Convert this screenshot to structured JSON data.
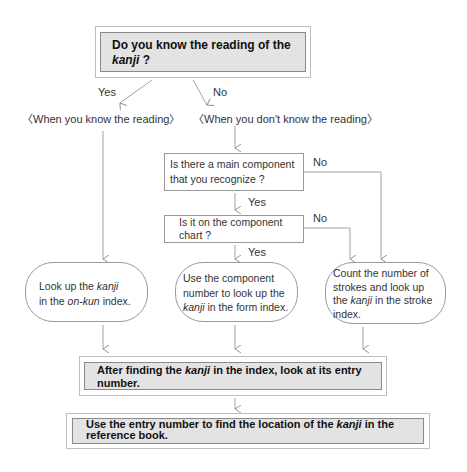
{
  "start": {
    "line1": "Do you know the reading of the",
    "line2_italic": "kanji",
    "line2_rest": " ?"
  },
  "branches": {
    "yes_label": "Yes",
    "no_label": "No",
    "known_heading": "〈When you know the reading〉",
    "unknown_heading": "〈When you don't know the reading〉"
  },
  "questions": {
    "main_component": {
      "line1": "Is there a main component",
      "line2": "that you recognize ?",
      "yes_label": "Yes",
      "no_label": "No"
    },
    "component_chart": {
      "line1": "Is it on the component",
      "line2": "chart ?",
      "yes_label": "Yes",
      "no_label": "No"
    }
  },
  "actions": {
    "onkun": {
      "t1": "Look up the ",
      "t2_italic": "kanji",
      "t3": "in the ",
      "t4_italic": "on-kun",
      "t5": " index."
    },
    "form": {
      "t1": "Use the component",
      "t2": "number to look up the",
      "t3_italic": "kanji",
      "t4": " in the form index."
    },
    "stroke": {
      "t1": "Count the number of",
      "t2": "strokes and look up",
      "t3": "the ",
      "t4_italic": "kanji",
      "t5": " in the stroke",
      "t6": "index."
    }
  },
  "entry_step": {
    "t1": "After finding the ",
    "t2_italic": "kanji",
    "t3": " in the index, look at its entry",
    "t4": "number."
  },
  "final_step": {
    "t1": "Use the entry number to find the location of the ",
    "t2_italic": "kanji",
    "t3": " in the",
    "t4": "reference book."
  }
}
